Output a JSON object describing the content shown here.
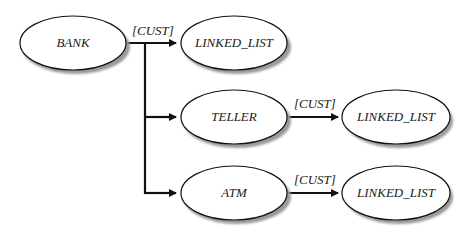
{
  "diagram": {
    "type": "class-hierarchy",
    "nodes": [
      {
        "id": "bank",
        "label": "BANK"
      },
      {
        "id": "ll1",
        "label": "LINKED_LIST"
      },
      {
        "id": "teller",
        "label": "TELLER"
      },
      {
        "id": "ll2",
        "label": "LINKED_LIST"
      },
      {
        "id": "atm",
        "label": "ATM"
      },
      {
        "id": "ll3",
        "label": "LINKED_LIST"
      }
    ],
    "edges": [
      {
        "from": "bank",
        "to": "ll1",
        "label": "[CUST]"
      },
      {
        "from": "bank",
        "to": "teller",
        "label": ""
      },
      {
        "from": "bank",
        "to": "atm",
        "label": ""
      },
      {
        "from": "teller",
        "to": "ll2",
        "label": "[CUST]"
      },
      {
        "from": "atm",
        "to": "ll3",
        "label": "[CUST]"
      }
    ]
  },
  "colors": {
    "stroke": "#111111",
    "fill": "#ffffff",
    "shadow": "#9a9a9a"
  }
}
